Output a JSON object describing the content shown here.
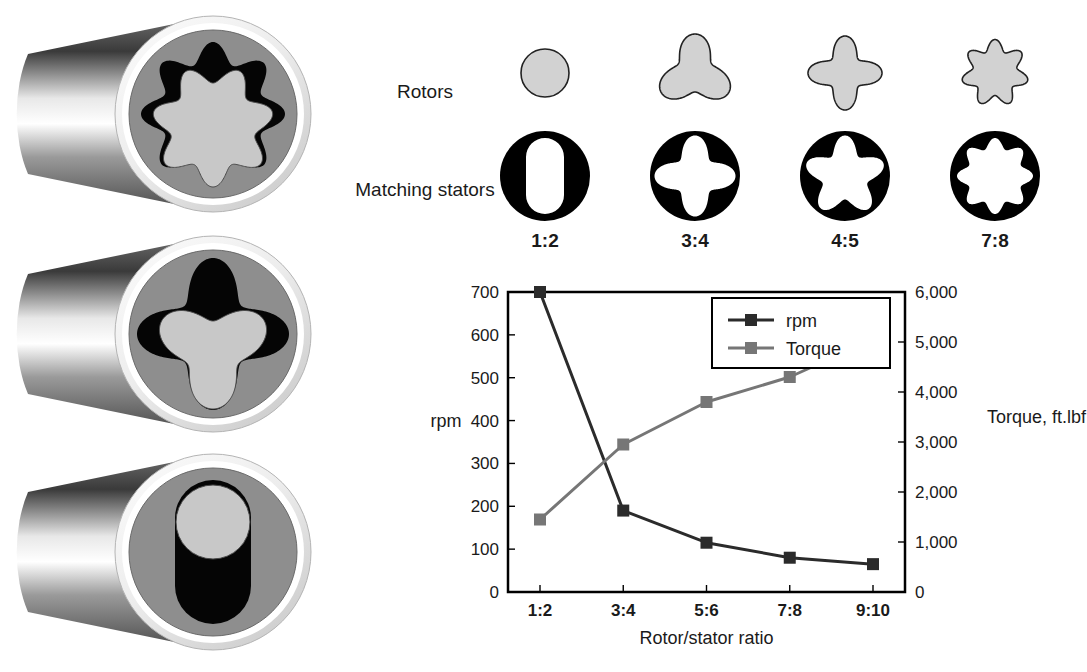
{
  "figure": {
    "rotor_row_label": "Rotors",
    "stator_row_label": "Matching stators",
    "columns": [
      {
        "ratio": "1:2",
        "rotor_lobes": 1,
        "stator_lobes": 2
      },
      {
        "ratio": "3:4",
        "rotor_lobes": 3,
        "stator_lobes": 4
      },
      {
        "ratio": "4:5",
        "rotor_lobes": 4,
        "stator_lobes": 5
      },
      {
        "ratio": "7:8",
        "rotor_lobes": 7,
        "stator_lobes": 8
      }
    ],
    "cylinders": [
      {
        "rotor_lobes": 7,
        "stator_lobes": 8
      },
      {
        "rotor_lobes": 3,
        "stator_lobes": 4
      },
      {
        "rotor_lobes": 1,
        "stator_lobes": 2
      }
    ]
  },
  "colors": {
    "rotor_fill": "#d2d2d2",
    "rotor_stroke": "#222222",
    "stator_fill": "#000000",
    "rpm_series": "#2b2b2b",
    "torque_series": "#767676",
    "axis": "#000000",
    "background": "#ffffff"
  },
  "chart_data": {
    "type": "line",
    "title": "",
    "xlabel": "Rotor/stator ratio",
    "ylabel": "rpm",
    "y2label": "Torque, ft.lbf",
    "categories": [
      "1:2",
      "3:4",
      "5:6",
      "7:8",
      "9:10"
    ],
    "grid": false,
    "legend_position": "top-right",
    "ylim": [
      0,
      700
    ],
    "yticks": [
      0,
      100,
      200,
      300,
      400,
      500,
      600,
      700
    ],
    "ytick_labels": [
      "0",
      "100",
      "200",
      "300",
      "400",
      "500",
      "600",
      "700"
    ],
    "y2lim": [
      0,
      6000
    ],
    "y2ticks": [
      0,
      1000,
      2000,
      3000,
      4000,
      5000,
      6000
    ],
    "y2tick_labels": [
      "0",
      "1,000",
      "2,000",
      "3,000",
      "4,000",
      "5,000",
      "6,000"
    ],
    "series": [
      {
        "name": "rpm",
        "axis": "left",
        "values": [
          700,
          190,
          115,
          80,
          65
        ]
      },
      {
        "name": "Torque",
        "axis": "right",
        "values": [
          1450,
          2950,
          3800,
          4300,
          5050
        ]
      }
    ]
  }
}
